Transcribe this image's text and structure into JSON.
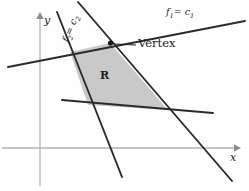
{
  "figure": {
    "type": "linear-programming-feasible-region-diagram",
    "axes": {
      "x_label": "x",
      "y_label": "y",
      "origin": [
        40,
        148
      ],
      "x_arrow_tip": [
        239,
        148
      ],
      "y_arrow_tip": [
        40,
        13
      ],
      "color": "#b0b0b0"
    },
    "region": {
      "label": "R",
      "fill_color": "#c9c9c9",
      "stroke_color": "#2a2a2a",
      "label_position": [
        103,
        77
      ],
      "vertices": [
        [
          110,
          43
        ],
        [
          70,
          52
        ],
        [
          88,
          105
        ],
        [
          168,
          110
        ]
      ]
    },
    "vertex_marker": {
      "label": "Vertex",
      "point": [
        110,
        43
      ],
      "label_position": [
        139,
        45
      ],
      "leader_from": [
        136,
        45
      ],
      "leader_to": [
        115,
        45
      ],
      "color": "#1a1a1a"
    },
    "constraint_lines": [
      {
        "name": "f1",
        "label": "f",
        "label_sub": "1",
        "label_equals": "= c",
        "label_equals_sub": "1",
        "label_text": "f1 = c1",
        "label_position": [
          168,
          11
        ],
        "rotation_deg": 0,
        "from": [
          8,
          67
        ],
        "to": [
          245,
          21
        ],
        "color": "#2a2a2a"
      },
      {
        "name": "f2",
        "label": "f",
        "label_sub": "2",
        "label_equals": "= c",
        "label_equals_sub": "2",
        "label_text": "f2 = c2",
        "label_position": [
          76,
          34
        ],
        "rotation_deg": -68,
        "from": [
          78,
          2
        ],
        "to": [
          232,
          181
        ],
        "color": "#2a2a2a"
      },
      {
        "name": "left-steep-line",
        "label_text": "",
        "from": [
          57,
          12
        ],
        "to": [
          122,
          177
        ],
        "color": "#2a2a2a"
      },
      {
        "name": "lower-shallow-line",
        "label_text": "",
        "from": [
          62,
          100
        ],
        "to": [
          213,
          113
        ],
        "color": "#2a2a2a"
      }
    ]
  }
}
